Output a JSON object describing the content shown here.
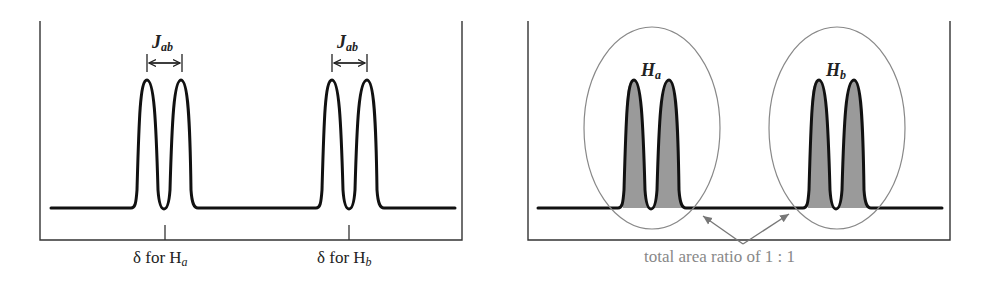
{
  "left_panel": {
    "coupling_labels": [
      {
        "main": "J",
        "sub": "ab"
      },
      {
        "main": "J",
        "sub": "ab"
      }
    ],
    "axis_labels": [
      {
        "prefix": "δ for H",
        "sub": "a"
      },
      {
        "prefix": "δ for H",
        "sub": "b"
      }
    ]
  },
  "right_panel": {
    "group_labels": [
      {
        "main": "H",
        "sub": "a"
      },
      {
        "main": "H",
        "sub": "b"
      }
    ],
    "annotation": "total area ratio of 1 : 1"
  },
  "colors": {
    "line": "#111111",
    "frame": "#333333",
    "shading": "#9a9a9a",
    "ellipse": "#888888",
    "annotation": "#888888"
  }
}
